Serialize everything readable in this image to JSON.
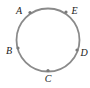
{
  "diagram": {
    "type": "circle-with-points",
    "circle": {
      "cx": 48,
      "cy": 40,
      "r": 31.5,
      "stroke": "#8a8a8a",
      "stroke_width": 1.8
    },
    "point_color": "#7a7a7a",
    "points": [
      {
        "label": "A",
        "x": 30,
        "y": 12.5,
        "lx": 19,
        "ly": 14
      },
      {
        "label": "E",
        "x": 66,
        "y": 12,
        "lx": 74.5,
        "ly": 14
      },
      {
        "label": "B",
        "x": 18,
        "y": 48,
        "lx": 9,
        "ly": 54
      },
      {
        "label": "D",
        "x": 77,
        "y": 50,
        "lx": 84,
        "ly": 56
      },
      {
        "label": "C",
        "x": 48,
        "y": 70.5,
        "lx": 48,
        "ly": 82
      }
    ]
  }
}
